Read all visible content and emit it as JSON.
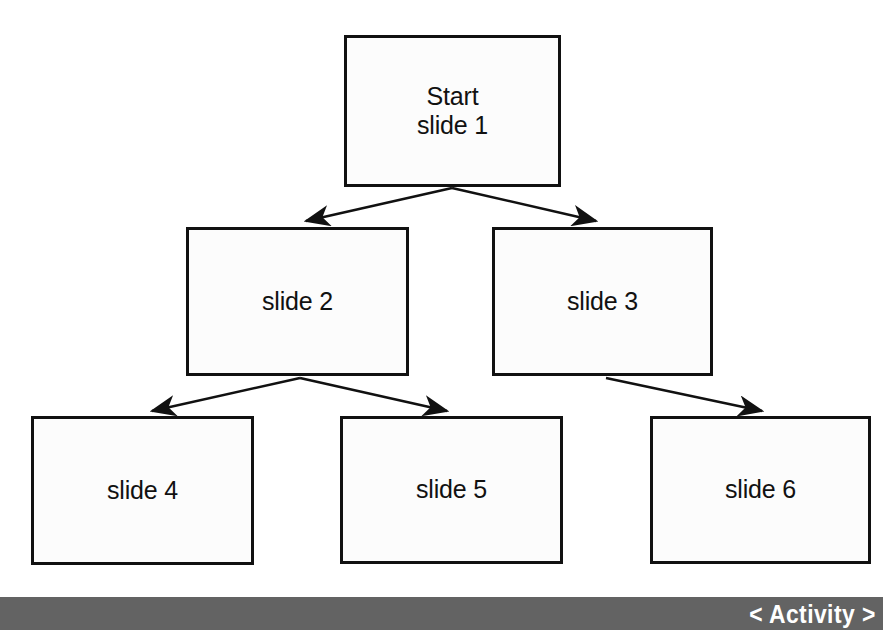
{
  "diagram": {
    "type": "flowchart",
    "background_color": "#ffffff",
    "node_fill_color": "#fcfcfc",
    "node_border_color": "#111111",
    "nodes": [
      {
        "id": "node-1",
        "label": "Start\nslide 1",
        "level": 1
      },
      {
        "id": "node-2",
        "label": "slide 2",
        "level": 2
      },
      {
        "id": "node-3",
        "label": "slide 3",
        "level": 2
      },
      {
        "id": "node-4",
        "label": "slide 4",
        "level": 3
      },
      {
        "id": "node-5",
        "label": "slide 5",
        "level": 3
      },
      {
        "id": "node-6",
        "label": "slide 6",
        "level": 3
      }
    ],
    "edges": [
      {
        "from": "node-1",
        "to": "node-2",
        "arrowhead": "solid"
      },
      {
        "from": "node-1",
        "to": "node-3",
        "arrowhead": "solid"
      },
      {
        "from": "node-2",
        "to": "node-4",
        "arrowhead": "solid"
      },
      {
        "from": "node-2",
        "to": "node-5",
        "arrowhead": "solid"
      },
      {
        "from": "node-3",
        "to": "node-6",
        "arrowhead": "solid"
      }
    ]
  },
  "footer": {
    "label": "< Activity >",
    "background_color": "#636363",
    "text_color": "#ffffff"
  }
}
